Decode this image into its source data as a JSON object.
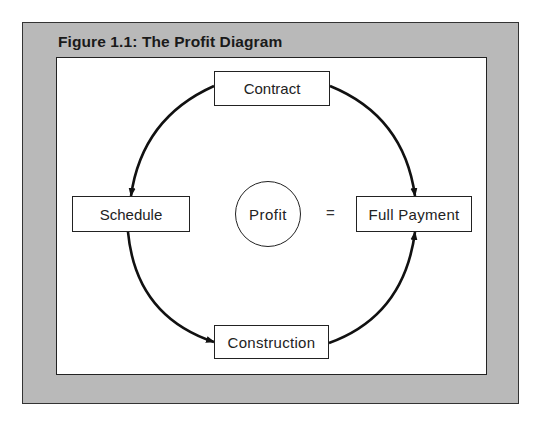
{
  "figure": {
    "title": "Figure 1.1: The Profit Diagram"
  },
  "diagram": {
    "nodes": {
      "contract": "Contract",
      "schedule": "Schedule",
      "construction": "Construction",
      "full_payment": "Full Payment",
      "profit": "Profit"
    },
    "equation_operator": "=",
    "edges": [
      {
        "from": "Contract",
        "to": "Schedule"
      },
      {
        "from": "Schedule",
        "to": "Construction"
      },
      {
        "from": "Construction",
        "to": "Full Payment"
      },
      {
        "from": "Contract",
        "to": "Full Payment"
      }
    ],
    "relation": "Profit = Full Payment"
  },
  "colors": {
    "frame": "#b9b9b9",
    "panel": "#ffffff",
    "stroke": "#111111"
  }
}
